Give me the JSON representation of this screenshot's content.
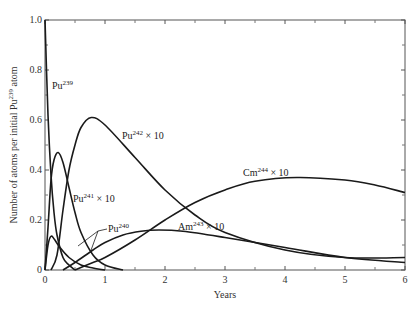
{
  "chart_data": {
    "type": "line",
    "title": "",
    "xlabel": "Years",
    "ylabel": "Number of atoms per initial Pu239 atom",
    "xlim": [
      0,
      6
    ],
    "ylim": [
      0,
      1.0
    ],
    "x_ticks": [
      "0",
      "1",
      "2",
      "3",
      "4",
      "5",
      "6"
    ],
    "y_ticks": [
      "0",
      "0.2",
      "0.4",
      "0.6",
      "0.8",
      "1.0"
    ],
    "grid": false,
    "legend": "inline labels",
    "series": [
      {
        "name": "Pu239",
        "label": "Pu",
        "sup": "239",
        "scale": "",
        "x": [
          0,
          0.05,
          0.1,
          0.15,
          0.2,
          0.3,
          0.4,
          0.5
        ],
        "y": [
          1.0,
          0.62,
          0.38,
          0.23,
          0.14,
          0.05,
          0.02,
          0.0
        ]
      },
      {
        "name": "Pu240",
        "label": "Pu",
        "sup": "240",
        "scale": "",
        "x": [
          0,
          0.05,
          0.1,
          0.15,
          0.25,
          0.4,
          0.6,
          0.8,
          1.0
        ],
        "y": [
          0,
          0.1,
          0.135,
          0.125,
          0.09,
          0.05,
          0.02,
          0.008,
          0.0
        ]
      },
      {
        "name": "Pu241 x 10",
        "label": "Pu",
        "sup": "241",
        "scale": " × 10",
        "x": [
          0,
          0.05,
          0.1,
          0.15,
          0.22,
          0.3,
          0.4,
          0.5,
          0.6,
          0.8,
          1.0,
          1.3
        ],
        "y": [
          0,
          0.17,
          0.36,
          0.44,
          0.47,
          0.43,
          0.33,
          0.23,
          0.15,
          0.06,
          0.02,
          0.0
        ]
      },
      {
        "name": "Pu242 x 10",
        "label": "Pu",
        "sup": "242",
        "scale": " × 10",
        "x": [
          0.1,
          0.2,
          0.3,
          0.4,
          0.5,
          0.6,
          0.77,
          1.0,
          1.5,
          2.0,
          2.5,
          3.0,
          4.0,
          5.0,
          6.0
        ],
        "y": [
          0.0,
          0.06,
          0.24,
          0.4,
          0.5,
          0.57,
          0.61,
          0.58,
          0.45,
          0.32,
          0.22,
          0.15,
          0.08,
          0.05,
          0.05
        ]
      },
      {
        "name": "Am243 x 10",
        "label": "Am",
        "sup": "243",
        "scale": " × 10",
        "x": [
          0.3,
          0.5,
          0.8,
          1.0,
          1.3,
          1.6,
          1.9,
          2.3,
          3.0,
          4.0,
          5.0,
          6.0
        ],
        "y": [
          0.0,
          0.03,
          0.08,
          0.11,
          0.14,
          0.155,
          0.16,
          0.155,
          0.13,
          0.09,
          0.05,
          0.03
        ]
      },
      {
        "name": "Cm244 x 10",
        "label": "Cm",
        "sup": "244",
        "scale": " × 10",
        "x": [
          0.5,
          0.8,
          1.0,
          1.5,
          2.0,
          2.5,
          3.0,
          3.5,
          4.2,
          5.0,
          5.5,
          6.0
        ],
        "y": [
          0.0,
          0.03,
          0.05,
          0.12,
          0.2,
          0.27,
          0.32,
          0.355,
          0.37,
          0.36,
          0.34,
          0.31
        ]
      }
    ]
  },
  "labels": {
    "ylabel_main": "Number of atoms per initial Pu",
    "ylabel_sup": "239",
    "ylabel_end": " atom",
    "xlabel": "Years"
  }
}
